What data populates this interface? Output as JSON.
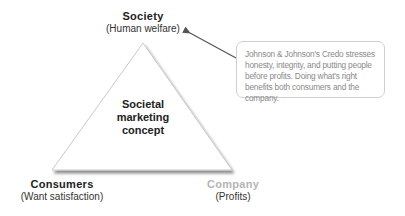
{
  "diagram": {
    "type": "triangle",
    "center": {
      "lines": [
        "Societal",
        "marketing",
        "concept"
      ]
    },
    "vertices": {
      "top": {
        "title": "Society",
        "subtitle": "(Human welfare)"
      },
      "bottom_left": {
        "title": "Consumers",
        "subtitle": "(Want satisfaction)"
      },
      "bottom_right": {
        "title": "Company",
        "subtitle": "(Profits)"
      }
    },
    "callout": {
      "text": "Johnson & Johnson's Credo stresses honesty, integrity, and putting people before profits.  Doing what's right benefits both consumers and the company.",
      "points_to": "Society"
    },
    "colors": {
      "triangle_stroke": "#c8c8c8",
      "triangle_shadow": "#9a9a9a",
      "arrow": "#555555",
      "callout_border": "#cfcfcf",
      "callout_text": "#8a8a8a",
      "company_title": "#b5b5b5",
      "text": "#222222"
    }
  }
}
